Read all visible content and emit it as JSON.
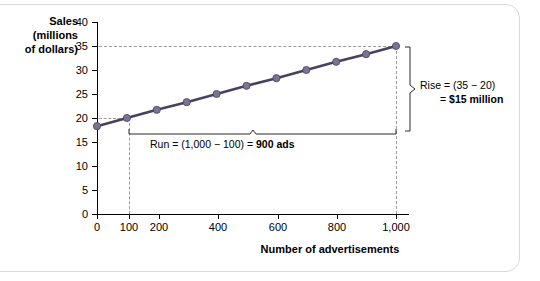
{
  "chart_data": {
    "type": "line",
    "title": "",
    "xlabel": "Number of advertisements",
    "ylabel": "Sales (millions of dollars)",
    "ylabel_lines": [
      "Sales",
      "(millions",
      "of dollars)"
    ],
    "x": [
      0,
      100,
      200,
      300,
      400,
      500,
      600,
      700,
      800,
      900,
      1000
    ],
    "values": [
      18.3,
      20.0,
      21.7,
      23.3,
      25.0,
      26.7,
      28.3,
      30.0,
      31.7,
      33.3,
      35.0
    ],
    "series": [
      {
        "name": "Sales",
        "values": [
          18.3,
          20.0,
          21.7,
          23.3,
          25.0,
          26.7,
          28.3,
          30.0,
          31.7,
          33.3,
          35.0
        ]
      }
    ],
    "xlim": [
      0,
      1000
    ],
    "ylim": [
      0,
      40
    ],
    "yticks": [
      0,
      5,
      10,
      15,
      20,
      25,
      30,
      35,
      40
    ],
    "ytick_labels": [
      "0",
      "5",
      "10",
      "15",
      "20",
      "25",
      "30",
      "35",
      "40"
    ],
    "xticks": [
      0,
      100,
      200,
      300,
      400,
      500,
      600,
      700,
      800,
      900,
      1000
    ],
    "xtick_labels": [
      "0",
      "100",
      "200",
      "",
      "400",
      "",
      "600",
      "",
      "800",
      "",
      "1,000"
    ],
    "grid": false,
    "legend": "none",
    "line_color": "#4a4060",
    "marker_color": "#7b7490",
    "annotations": [
      {
        "name": "run",
        "text_plain": "Run = (1,000 − 100) = ",
        "text_bold": "900 ads",
        "from_x": 100,
        "to_x": 1000,
        "value": 900
      },
      {
        "name": "rise",
        "line1": "Rise = (35 − 20)",
        "line2_plain": "= ",
        "line2_bold": "$15 million",
        "from_y": 20,
        "to_y": 35,
        "value": 15
      }
    ],
    "guide_lines": [
      {
        "type": "horizontal",
        "y": 35
      },
      {
        "type": "horizontal",
        "y": 20
      },
      {
        "type": "vertical",
        "x": 100
      },
      {
        "type": "vertical",
        "x": 1000
      }
    ]
  }
}
